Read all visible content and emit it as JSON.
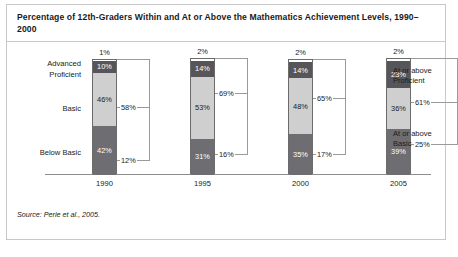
{
  "figure": {
    "title": "Percentage of 12th-Graders Within and At or Above the Mathematics Achievement Levels, 1990–2000",
    "source": "Source: Perie et al., 2005."
  },
  "axis_labels": {
    "advanced": "Advanced",
    "proficient": "Proficient",
    "basic": "Basic",
    "below_basic": "Below Basic"
  },
  "side_labels": {
    "at_or_above_proficient": "At or above\nProficient",
    "at_or_above_proficient_line1": "At or above",
    "at_or_above_proficient_line2": "Proficient",
    "at_or_above_basic_line1": "At or above",
    "at_or_above_basic_line2": "Basic"
  },
  "chart_data": {
    "type": "bar",
    "subtype": "stacked-100",
    "title": "Percentage of 12th-Graders Within and At or Above the Mathematics Achievement Levels, 1990–2000",
    "xlabel": "",
    "ylabel": "",
    "ylim": [
      0,
      100
    ],
    "grid": false,
    "legend": "none",
    "categories": [
      "1990",
      "1995",
      "2000",
      "2005"
    ],
    "series": [
      {
        "name": "Advanced",
        "values": [
          1,
          2,
          2,
          2
        ],
        "labels": [
          "1%",
          "2%",
          "2%",
          "2%"
        ],
        "color": "#ffffff"
      },
      {
        "name": "Proficient",
        "values": [
          10,
          14,
          14,
          23
        ],
        "labels": [
          "10%",
          "14%",
          "14%",
          "23%"
        ],
        "color": "#56565a"
      },
      {
        "name": "Basic",
        "values": [
          46,
          53,
          48,
          36
        ],
        "labels": [
          "46%",
          "53%",
          "48%",
          "36%"
        ],
        "color": "#cfcfcf"
      },
      {
        "name": "Below Basic",
        "values": [
          42,
          31,
          35,
          39
        ],
        "labels": [
          "42%",
          "31%",
          "35%",
          "39%"
        ],
        "color": "#6e6e72"
      }
    ],
    "cumulative": [
      {
        "name": "At or above Proficient",
        "values": [
          12,
          16,
          17,
          25
        ],
        "labels": [
          "12%",
          "16%",
          "17%",
          "25%"
        ]
      },
      {
        "name": "At or above Basic",
        "values": [
          58,
          69,
          65,
          61
        ],
        "labels": [
          "58%",
          "69%",
          "65%",
          "61%"
        ]
      }
    ]
  }
}
